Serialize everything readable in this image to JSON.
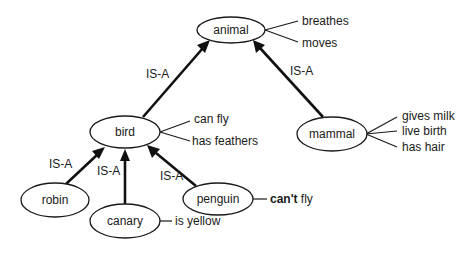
{
  "diagram": {
    "type": "semantic-network",
    "nodes": {
      "animal": {
        "label": "animal"
      },
      "bird": {
        "label": "bird"
      },
      "mammal": {
        "label": "mammal"
      },
      "robin": {
        "label": "robin"
      },
      "canary": {
        "label": "canary"
      },
      "penguin": {
        "label": "penguin"
      }
    },
    "attributes": {
      "animal": [
        "breathes",
        "moves"
      ],
      "bird": [
        "can fly",
        "has feathers"
      ],
      "mammal": [
        "gives milk",
        "live birth",
        "has hair"
      ],
      "canary": [
        "is yellow"
      ],
      "penguin": {
        "bold_part": "can't",
        "rest": " fly"
      }
    },
    "edges": [
      {
        "from": "bird",
        "to": "animal",
        "label": "IS-A"
      },
      {
        "from": "mammal",
        "to": "animal",
        "label": "IS-A"
      },
      {
        "from": "robin",
        "to": "bird",
        "label": "IS-A"
      },
      {
        "from": "canary",
        "to": "bird",
        "label": "IS-A"
      },
      {
        "from": "penguin",
        "to": "bird",
        "label": "IS-A"
      }
    ]
  }
}
